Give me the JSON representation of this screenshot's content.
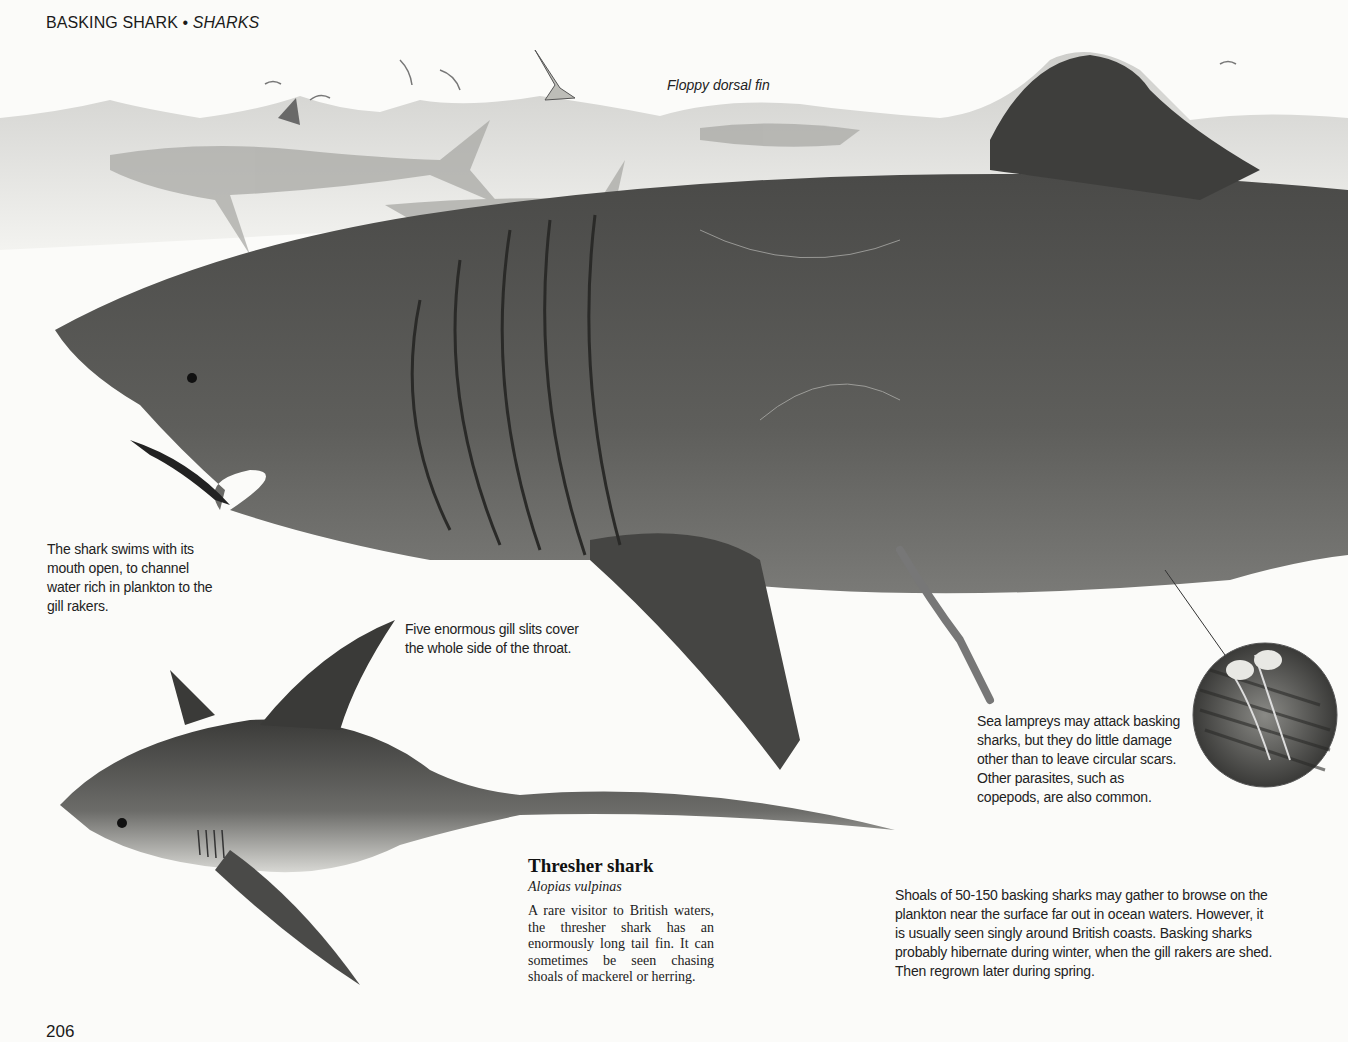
{
  "header": {
    "topic": "BASKING SHARK",
    "separator": "•",
    "section": "SHARKS"
  },
  "illustration": {
    "description": "Underwater illustration of a large basking shark with open mouth near the surface, a shoal of basking sharks and seagulls in background, a thresher shark in the foreground, and a magnified circular inset of parasites",
    "labels": {
      "dorsal_fin": "Floppy dorsal fin"
    }
  },
  "captions": {
    "mouth": "The shark swims with its mouth open, to channel water rich in plankton to the gill rakers.",
    "gills": "Five enormous gill slits cover the whole side of the throat.",
    "lampreys": "Sea lampreys may attack basking sharks, but they do little damage other than to leave circular scars. Other parasites, such as copepods, are also common.",
    "shoals": "Shoals of 50-150 basking sharks may gather to browse on the plankton near the surface far out in ocean waters. However, it is usually seen singly around British coasts. Basking sharks probably hibernate during winter, when the gill rakers are shed. Then regrown later during spring."
  },
  "thresher": {
    "title": "Thresher shark",
    "latin": "Alopias vulpinas",
    "body": "A rare visitor to British waters, the thresher shark has an enormously long tail fin. It can sometimes be seen chasing shoals of mackerel or herring."
  },
  "footer": {
    "page_number": "206"
  }
}
